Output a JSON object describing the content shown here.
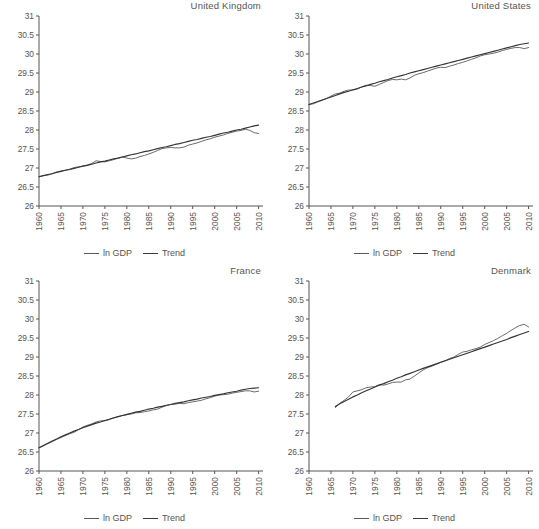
{
  "figure": {
    "width": 539,
    "height": 529,
    "background": "#ffffff",
    "line_color_gdp": "#6a6a6a",
    "line_color_trend": "#333333"
  },
  "legend": {
    "gdp_label": "ln GDP",
    "trend_label": "Trend"
  },
  "axis": {
    "y_ticks": [
      "26",
      "26.5",
      "27",
      "27.5",
      "28",
      "28.5",
      "29",
      "29.5",
      "30",
      "30.5",
      "31"
    ],
    "x_ticks": [
      "1960",
      "1965",
      "1970",
      "1975",
      "1980",
      "1985",
      "1990",
      "1995",
      "2000",
      "2005",
      "2010"
    ],
    "ylim": [
      26,
      31
    ],
    "xlim": [
      1960,
      2011
    ],
    "grid": false
  },
  "chart_data": [
    {
      "type": "line",
      "title": "United Kingdom",
      "xlabel": "",
      "ylabel": "",
      "ylim": [
        26,
        31
      ],
      "xlim": [
        1960,
        2011
      ],
      "grid": false,
      "legend_position": "bottom-center",
      "x": [
        1960,
        1961,
        1962,
        1963,
        1964,
        1965,
        1966,
        1967,
        1968,
        1969,
        1970,
        1971,
        1972,
        1973,
        1974,
        1975,
        1976,
        1977,
        1978,
        1979,
        1980,
        1981,
        1982,
        1983,
        1984,
        1985,
        1986,
        1987,
        1988,
        1989,
        1990,
        1991,
        1992,
        1993,
        1994,
        1995,
        1996,
        1997,
        1998,
        1999,
        2000,
        2001,
        2002,
        2003,
        2004,
        2005,
        2006,
        2007,
        2008,
        2009,
        2010
      ],
      "series": [
        {
          "name": "ln GDP",
          "values": [
            26.77,
            26.8,
            26.81,
            26.85,
            26.9,
            26.92,
            26.94,
            26.97,
            27.01,
            27.03,
            27.05,
            27.08,
            27.12,
            27.19,
            27.17,
            27.16,
            27.19,
            27.22,
            27.26,
            27.29,
            27.26,
            27.24,
            27.26,
            27.3,
            27.33,
            27.37,
            27.41,
            27.46,
            27.51,
            27.53,
            27.54,
            27.53,
            27.53,
            27.55,
            27.6,
            27.63,
            27.66,
            27.7,
            27.74,
            27.77,
            27.81,
            27.84,
            27.87,
            27.91,
            27.94,
            27.97,
            27.99,
            28.02,
            27.99,
            27.93,
            27.91
          ]
        },
        {
          "name": "Trend",
          "values": [
            26.77,
            26.8,
            26.83,
            26.85,
            26.88,
            26.91,
            26.94,
            26.96,
            26.99,
            27.02,
            27.05,
            27.07,
            27.1,
            27.13,
            27.16,
            27.18,
            27.21,
            27.24,
            27.26,
            27.29,
            27.32,
            27.35,
            27.37,
            27.4,
            27.43,
            27.45,
            27.48,
            27.51,
            27.54,
            27.56,
            27.59,
            27.62,
            27.64,
            27.67,
            27.7,
            27.73,
            27.75,
            27.78,
            27.81,
            27.83,
            27.86,
            27.89,
            27.92,
            27.94,
            27.97,
            28.0,
            28.02,
            28.05,
            28.08,
            28.11,
            28.13
          ]
        }
      ]
    },
    {
      "type": "line",
      "title": "United States",
      "xlabel": "",
      "ylabel": "",
      "ylim": [
        26,
        31
      ],
      "xlim": [
        1960,
        2011
      ],
      "grid": false,
      "legend_position": "bottom-center",
      "x": [
        1960,
        1961,
        1962,
        1963,
        1964,
        1965,
        1966,
        1967,
        1968,
        1969,
        1970,
        1971,
        1972,
        1973,
        1974,
        1975,
        1976,
        1977,
        1978,
        1979,
        1980,
        1981,
        1982,
        1983,
        1984,
        1985,
        1986,
        1987,
        1988,
        1989,
        1990,
        1991,
        1992,
        1993,
        1994,
        1995,
        1996,
        1997,
        1998,
        1999,
        2000,
        2001,
        2002,
        2003,
        2004,
        2005,
        2006,
        2007,
        2008,
        2009,
        2010
      ],
      "series": [
        {
          "name": "ln GDP",
          "values": [
            28.67,
            28.69,
            28.74,
            28.78,
            28.83,
            28.89,
            28.95,
            28.97,
            29.02,
            29.05,
            29.05,
            29.08,
            29.13,
            29.18,
            29.17,
            29.15,
            29.2,
            29.25,
            29.3,
            29.33,
            29.32,
            29.34,
            29.32,
            29.37,
            29.44,
            29.48,
            29.51,
            29.55,
            29.59,
            29.63,
            29.65,
            29.64,
            29.68,
            29.71,
            29.75,
            29.78,
            29.82,
            29.86,
            29.9,
            29.95,
            29.98,
            30.0,
            30.02,
            30.05,
            30.09,
            30.12,
            30.15,
            30.17,
            30.17,
            30.14,
            30.17
          ]
        },
        {
          "name": "Trend",
          "values": [
            28.67,
            28.71,
            28.75,
            28.79,
            28.83,
            28.87,
            28.91,
            28.95,
            28.99,
            29.02,
            29.06,
            29.09,
            29.13,
            29.16,
            29.2,
            29.23,
            29.27,
            29.3,
            29.33,
            29.37,
            29.4,
            29.43,
            29.46,
            29.5,
            29.53,
            29.56,
            29.59,
            29.62,
            29.65,
            29.68,
            29.71,
            29.74,
            29.77,
            29.8,
            29.83,
            29.86,
            29.89,
            29.92,
            29.95,
            29.98,
            30.01,
            30.04,
            30.07,
            30.1,
            30.13,
            30.16,
            30.19,
            30.22,
            30.25,
            30.27,
            30.29
          ]
        }
      ]
    },
    {
      "type": "line",
      "title": "France",
      "xlabel": "",
      "ylabel": "",
      "ylim": [
        26,
        31
      ],
      "xlim": [
        1960,
        2011
      ],
      "grid": false,
      "legend_position": "bottom-center",
      "x": [
        1960,
        1961,
        1962,
        1963,
        1964,
        1965,
        1966,
        1967,
        1968,
        1969,
        1970,
        1971,
        1972,
        1973,
        1974,
        1975,
        1976,
        1977,
        1978,
        1979,
        1980,
        1981,
        1982,
        1983,
        1984,
        1985,
        1986,
        1987,
        1988,
        1989,
        1990,
        1991,
        1992,
        1993,
        1994,
        1995,
        1996,
        1997,
        1998,
        1999,
        2000,
        2001,
        2002,
        2003,
        2004,
        2005,
        2006,
        2007,
        2008,
        2009,
        2010
      ],
      "series": [
        {
          "name": "ln GDP",
          "values": [
            26.61,
            26.66,
            26.72,
            26.77,
            26.83,
            26.88,
            26.93,
            26.98,
            27.02,
            27.09,
            27.16,
            27.2,
            27.24,
            27.29,
            27.32,
            27.32,
            27.36,
            27.39,
            27.43,
            27.46,
            27.48,
            27.5,
            27.53,
            27.54,
            27.56,
            27.58,
            27.61,
            27.63,
            27.68,
            27.72,
            27.75,
            27.76,
            27.78,
            27.77,
            27.8,
            27.82,
            27.84,
            27.86,
            27.9,
            27.93,
            27.97,
            28.0,
            28.01,
            28.02,
            28.05,
            28.07,
            28.09,
            28.11,
            28.11,
            28.08,
            28.1
          ]
        },
        {
          "name": "Trend",
          "values": [
            26.61,
            26.67,
            26.73,
            26.79,
            26.84,
            26.9,
            26.95,
            27.0,
            27.05,
            27.09,
            27.14,
            27.18,
            27.22,
            27.26,
            27.29,
            27.33,
            27.36,
            27.4,
            27.43,
            27.46,
            27.49,
            27.52,
            27.55,
            27.57,
            27.6,
            27.63,
            27.65,
            27.68,
            27.7,
            27.73,
            27.75,
            27.78,
            27.8,
            27.82,
            27.85,
            27.87,
            27.89,
            27.92,
            27.94,
            27.96,
            27.99,
            28.01,
            28.03,
            28.06,
            28.08,
            28.1,
            28.13,
            28.15,
            28.17,
            28.18,
            28.19
          ]
        }
      ]
    },
    {
      "type": "line",
      "title": "Denmark",
      "xlabel": "",
      "ylabel": "",
      "ylim": [
        26,
        31
      ],
      "xlim": [
        1960,
        2011
      ],
      "grid": false,
      "legend_position": "bottom-center",
      "x": [
        1966,
        1967,
        1968,
        1969,
        1970,
        1971,
        1972,
        1973,
        1974,
        1975,
        1976,
        1977,
        1978,
        1979,
        1980,
        1981,
        1982,
        1983,
        1984,
        1985,
        1986,
        1987,
        1988,
        1989,
        1990,
        1991,
        1992,
        1993,
        1994,
        1995,
        1996,
        1997,
        1998,
        1999,
        2000,
        2001,
        2002,
        2003,
        2004,
        2005,
        2006,
        2007,
        2008,
        2009,
        2010
      ],
      "series": [
        {
          "name": "ln GDP",
          "values": [
            27.67,
            27.78,
            27.86,
            27.95,
            28.08,
            28.11,
            28.14,
            28.19,
            28.21,
            28.22,
            28.27,
            28.26,
            28.29,
            28.33,
            28.34,
            28.34,
            28.4,
            28.42,
            28.5,
            28.58,
            28.66,
            28.72,
            28.76,
            28.81,
            28.86,
            28.9,
            28.96,
            29.0,
            29.07,
            29.13,
            29.15,
            29.19,
            29.22,
            29.26,
            29.33,
            29.38,
            29.43,
            29.49,
            29.56,
            29.62,
            29.7,
            29.77,
            29.83,
            29.86,
            29.79
          ]
        },
        {
          "name": "Trend",
          "values": [
            27.7,
            27.77,
            27.83,
            27.89,
            27.95,
            28.0,
            28.06,
            28.11,
            28.16,
            28.21,
            28.26,
            28.3,
            28.35,
            28.39,
            28.44,
            28.48,
            28.53,
            28.57,
            28.61,
            28.66,
            28.7,
            28.74,
            28.78,
            28.82,
            28.86,
            28.9,
            28.94,
            28.98,
            29.02,
            29.06,
            29.1,
            29.14,
            29.18,
            29.22,
            29.26,
            29.3,
            29.34,
            29.38,
            29.42,
            29.46,
            29.51,
            29.55,
            29.59,
            29.63,
            29.67
          ]
        }
      ]
    }
  ]
}
